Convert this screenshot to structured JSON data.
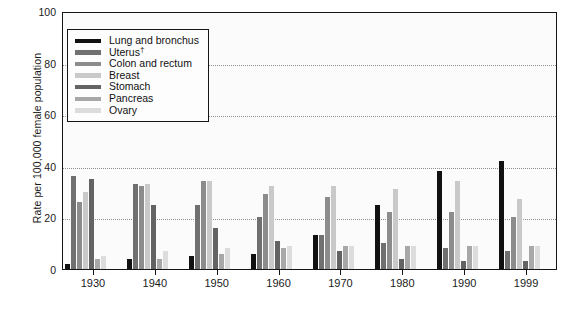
{
  "chart_data": {
    "type": "bar",
    "title": "",
    "subtitle": "",
    "xlabel": "",
    "ylabel": "Rate per 100,000 female population",
    "ylim": [
      0,
      100
    ],
    "yticks": [
      0,
      20,
      40,
      60,
      80,
      100
    ],
    "grid": true,
    "legend_position": "upper-left",
    "categories": [
      "1930",
      "1940",
      "1950",
      "1960",
      "1970",
      "1980",
      "1990",
      "1999"
    ],
    "series": [
      {
        "name": "Lung and bronchus",
        "color": "#111111",
        "values": [
          2,
          4,
          5,
          6,
          13,
          25,
          38,
          42
        ]
      },
      {
        "name": "Uterus",
        "color": "#707070",
        "values": [
          36,
          33,
          25,
          20,
          13,
          10,
          8,
          7
        ]
      },
      {
        "name": "Colon and rectum",
        "color": "#8c8c8c",
        "values": [
          26,
          32,
          34,
          29,
          28,
          22,
          22,
          20
        ]
      },
      {
        "name": "Breast",
        "color": "#c9c9c9",
        "values": [
          30,
          33,
          34,
          32,
          32,
          31,
          34,
          27
        ]
      },
      {
        "name": "Stomach",
        "color": "#636363",
        "values": [
          35,
          25,
          16,
          11,
          7,
          4,
          3,
          3
        ]
      },
      {
        "name": "Pancreas",
        "color": "#a8a8a8",
        "values": [
          4,
          4,
          6,
          8,
          9,
          9,
          9,
          9
        ]
      },
      {
        "name": "Ovary",
        "color": "#dcdcdc",
        "values": [
          5,
          7,
          8,
          9,
          9,
          9,
          9,
          9
        ]
      }
    ],
    "legend_entries": [
      {
        "label": "Lung and bronchus",
        "dagger": false,
        "color": "#111111"
      },
      {
        "label": "Uterus",
        "dagger": true,
        "color": "#707070"
      },
      {
        "label": "Colon and rectum",
        "dagger": false,
        "color": "#8c8c8c"
      },
      {
        "label": "Breast",
        "dagger": false,
        "color": "#c9c9c9"
      },
      {
        "label": "Stomach",
        "dagger": false,
        "color": "#636363"
      },
      {
        "label": "Pancreas",
        "dagger": false,
        "color": "#a8a8a8"
      },
      {
        "label": "Ovary",
        "dagger": false,
        "color": "#dcdcdc"
      }
    ]
  }
}
